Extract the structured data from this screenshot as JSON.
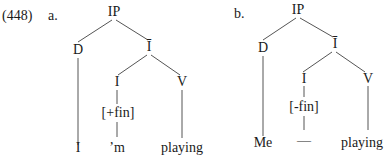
{
  "example_number": "(448)",
  "trees": [
    {
      "label": "a.",
      "nodes": {
        "root": "IP",
        "d": "D",
        "ibar": "Ī",
        "i": "I",
        "v": "V",
        "feature": "[+fin]",
        "d_leaf": "I",
        "i_leaf": "’m",
        "v_leaf": "playing"
      }
    },
    {
      "label": "b.",
      "nodes": {
        "root": "IP",
        "d": "D",
        "ibar": "Ī",
        "i": "I",
        "v": "V",
        "feature": "[-fin]",
        "d_leaf": "Me",
        "i_leaf": "—",
        "v_leaf": "playing"
      }
    }
  ]
}
